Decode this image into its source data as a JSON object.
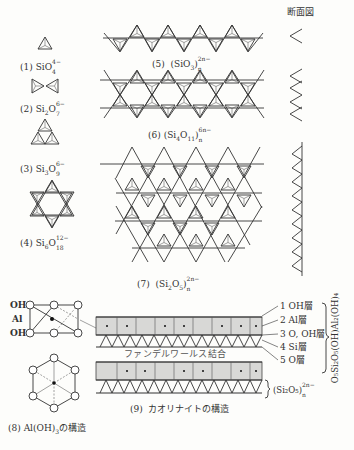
{
  "figure": {
    "section_view_title": "断面図",
    "structures": [
      {
        "num": "(1)",
        "formula": "SiO",
        "sub": "4",
        "sup": "4−"
      },
      {
        "num": "(2)",
        "formula": "Si",
        "sub1": "2",
        "mid": "O",
        "sub": "7",
        "sup": "6−"
      },
      {
        "num": "(3)",
        "formula": "Si",
        "sub1": "3",
        "mid": "O",
        "sub": "9",
        "sup": "6−"
      },
      {
        "num": "(4)",
        "formula": "Si",
        "sub1": "6",
        "mid": "O",
        "sub": "18",
        "sup": "12−"
      },
      {
        "num": "(5)",
        "formula": "(SiO",
        "sub1": "3",
        "mid": ")",
        "sub": "n",
        "sup": "2n−"
      },
      {
        "num": "(6)",
        "formula": "(Si",
        "sub1": "4",
        "mid": "O",
        "sub2": "11",
        "end": ")",
        "sub": "n",
        "sup": "6n−"
      },
      {
        "num": "(7)",
        "formula": "(Si",
        "sub1": "2",
        "mid": "O",
        "sub2": "5",
        "end": ")",
        "sub": "n",
        "sup": "2n−"
      }
    ],
    "aloh": {
      "labels": [
        "OH",
        "Al",
        "OH"
      ],
      "caption_num": "(8)",
      "caption_text": "Al(OH)",
      "caption_sub": "3",
      "caption_suffix": "の構造"
    },
    "kaolinite": {
      "van_der_waals_label": "ファンデルワールス結合",
      "caption_num": "(9)",
      "caption_text": "カオリナイトの構造",
      "layers": [
        {
          "num": "1",
          "name": "OH層"
        },
        {
          "num": "2",
          "name": "Al層"
        },
        {
          "num": "3",
          "name": "O, OH層"
        },
        {
          "num": "4",
          "name": "Si層"
        },
        {
          "num": "5",
          "name": "O層"
        }
      ],
      "formula_vertical": "O₅Si₂O₅(OH)Al₂(OH)₄",
      "bracket_formula": "(Si₂O₅)",
      "bracket_sub": "n",
      "bracket_sup": "2n−"
    }
  }
}
